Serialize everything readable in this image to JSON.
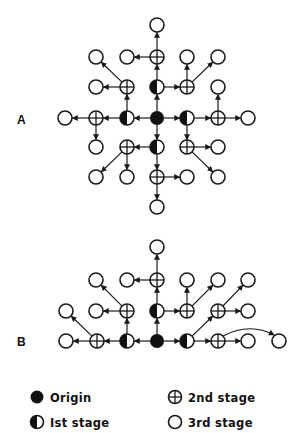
{
  "figure": {
    "panels": [
      {
        "label": "A",
        "label_pos": [
          22,
          124
        ],
        "nodes": [
          {
            "id": "o",
            "x": 157,
            "y": 118,
            "type": "origin"
          },
          {
            "id": "n1",
            "x": 157,
            "y": 87,
            "type": "first"
          },
          {
            "id": "w1",
            "x": 127,
            "y": 118,
            "type": "first"
          },
          {
            "id": "e1",
            "x": 187,
            "y": 118,
            "type": "first"
          },
          {
            "id": "s1",
            "x": 157,
            "y": 147,
            "type": "first"
          },
          {
            "id": "n2",
            "x": 157,
            "y": 57,
            "type": "second"
          },
          {
            "id": "nw2",
            "x": 127,
            "y": 87,
            "type": "second"
          },
          {
            "id": "ne2",
            "x": 187,
            "y": 87,
            "type": "second"
          },
          {
            "id": "w2",
            "x": 96,
            "y": 118,
            "type": "second"
          },
          {
            "id": "e2",
            "x": 218,
            "y": 118,
            "type": "second"
          },
          {
            "id": "sw2",
            "x": 127,
            "y": 147,
            "type": "second"
          },
          {
            "id": "se2",
            "x": 187,
            "y": 147,
            "type": "second"
          },
          {
            "id": "s2",
            "x": 157,
            "y": 177,
            "type": "second"
          },
          {
            "id": "a1",
            "x": 157,
            "y": 25,
            "type": "third"
          },
          {
            "id": "a2",
            "x": 127,
            "y": 57,
            "type": "third"
          },
          {
            "id": "a3",
            "x": 96,
            "y": 57,
            "type": "third"
          },
          {
            "id": "a4",
            "x": 96,
            "y": 87,
            "type": "third"
          },
          {
            "id": "a5",
            "x": 187,
            "y": 57,
            "type": "third"
          },
          {
            "id": "a6",
            "x": 218,
            "y": 57,
            "type": "third"
          },
          {
            "id": "a7",
            "x": 218,
            "y": 87,
            "type": "third"
          },
          {
            "id": "a8",
            "x": 65,
            "y": 118,
            "type": "third"
          },
          {
            "id": "a9",
            "x": 248,
            "y": 118,
            "type": "third"
          },
          {
            "id": "a10",
            "x": 96,
            "y": 147,
            "type": "third"
          },
          {
            "id": "a11",
            "x": 96,
            "y": 177,
            "type": "third"
          },
          {
            "id": "a12",
            "x": 127,
            "y": 177,
            "type": "third"
          },
          {
            "id": "a13",
            "x": 218,
            "y": 147,
            "type": "third"
          },
          {
            "id": "a14",
            "x": 218,
            "y": 177,
            "type": "third"
          },
          {
            "id": "a15",
            "x": 187,
            "y": 177,
            "type": "third"
          },
          {
            "id": "a16",
            "x": 157,
            "y": 207,
            "type": "third"
          }
        ],
        "edges": [
          [
            "o",
            "n1"
          ],
          [
            "o",
            "w1"
          ],
          [
            "o",
            "e1"
          ],
          [
            "o",
            "s1"
          ],
          [
            "n1",
            "n2"
          ],
          [
            "n1",
            "ne2"
          ],
          [
            "w1",
            "nw2"
          ],
          [
            "w1",
            "w2"
          ],
          [
            "e1",
            "e2"
          ],
          [
            "e1",
            "se2"
          ],
          [
            "s1",
            "sw2"
          ],
          [
            "s1",
            "s2"
          ],
          [
            "n2",
            "a1"
          ],
          [
            "n2",
            "a2"
          ],
          [
            "nw2",
            "a3"
          ],
          [
            "nw2",
            "a4"
          ],
          [
            "ne2",
            "a5"
          ],
          [
            "ne2",
            "a6"
          ],
          [
            "e2",
            "a7"
          ],
          [
            "e2",
            "a9"
          ],
          [
            "w2",
            "a8"
          ],
          [
            "w2",
            "a10"
          ],
          [
            "sw2",
            "a11"
          ],
          [
            "sw2",
            "a12"
          ],
          [
            "se2",
            "a13"
          ],
          [
            "se2",
            "a14"
          ],
          [
            "s2",
            "a15"
          ],
          [
            "s2",
            "a16"
          ]
        ]
      },
      {
        "label": "B",
        "label_pos": [
          22,
          346
        ],
        "nodes": [
          {
            "id": "o",
            "x": 157,
            "y": 341,
            "type": "origin"
          },
          {
            "id": "n1",
            "x": 157,
            "y": 311,
            "type": "first"
          },
          {
            "id": "w1",
            "x": 127,
            "y": 341,
            "type": "first"
          },
          {
            "id": "e1",
            "x": 187,
            "y": 341,
            "type": "first"
          },
          {
            "id": "n2",
            "x": 157,
            "y": 280,
            "type": "second"
          },
          {
            "id": "ne2",
            "x": 187,
            "y": 311,
            "type": "second"
          },
          {
            "id": "nw2",
            "x": 127,
            "y": 311,
            "type": "second"
          },
          {
            "id": "w2",
            "x": 97,
            "y": 341,
            "type": "second"
          },
          {
            "id": "e2",
            "x": 218,
            "y": 341,
            "type": "second"
          },
          {
            "id": "ee2",
            "x": 218,
            "y": 311,
            "type": "second"
          },
          {
            "id": "b1",
            "x": 157,
            "y": 247,
            "type": "third"
          },
          {
            "id": "b2",
            "x": 127,
            "y": 280,
            "type": "third"
          },
          {
            "id": "b3",
            "x": 96,
            "y": 280,
            "type": "third"
          },
          {
            "id": "b4",
            "x": 96,
            "y": 311,
            "type": "third"
          },
          {
            "id": "b5",
            "x": 66,
            "y": 311,
            "type": "third"
          },
          {
            "id": "b6",
            "x": 66,
            "y": 341,
            "type": "third"
          },
          {
            "id": "b7",
            "x": 187,
            "y": 280,
            "type": "third"
          },
          {
            "id": "b8",
            "x": 218,
            "y": 280,
            "type": "third"
          },
          {
            "id": "b9",
            "x": 248,
            "y": 280,
            "type": "third"
          },
          {
            "id": "b10",
            "x": 248,
            "y": 311,
            "type": "third"
          },
          {
            "id": "b11",
            "x": 248,
            "y": 341,
            "type": "third"
          },
          {
            "id": "b12",
            "x": 279,
            "y": 341,
            "type": "third"
          }
        ],
        "edges": [
          [
            "o",
            "n1"
          ],
          [
            "o",
            "w1"
          ],
          [
            "o",
            "e1"
          ],
          [
            "n1",
            "n2"
          ],
          [
            "n1",
            "ne2"
          ],
          [
            "w1",
            "nw2"
          ],
          [
            "w1",
            "w2"
          ],
          [
            "e1",
            "ee2"
          ],
          [
            "e1",
            "e2"
          ],
          [
            "n2",
            "b1"
          ],
          [
            "n2",
            "b2"
          ],
          [
            "nw2",
            "b3"
          ],
          [
            "nw2",
            "b4"
          ],
          [
            "w2",
            "b5"
          ],
          [
            "w2",
            "b6"
          ],
          [
            "ne2",
            "b7"
          ],
          [
            "ne2",
            "b8"
          ],
          [
            "ee2",
            "b9"
          ],
          [
            "ee2",
            "b10"
          ],
          [
            "e2",
            "b11"
          ]
        ],
        "curved_edges": [
          {
            "from": "e2",
            "to": "b12",
            "control": [
              250,
              322
            ]
          }
        ]
      }
    ],
    "legend": [
      {
        "type": "origin",
        "label": "Origin",
        "x": 37,
        "y": 397
      },
      {
        "type": "first",
        "label": "Ist stage",
        "x": 37,
        "y": 422
      },
      {
        "type": "second",
        "label": "2nd stage",
        "x": 175,
        "y": 397
      },
      {
        "type": "third",
        "label": "3rd stage",
        "x": 175,
        "y": 422
      }
    ],
    "colors": {
      "ink": "#111111",
      "background": "#ffffff"
    }
  }
}
